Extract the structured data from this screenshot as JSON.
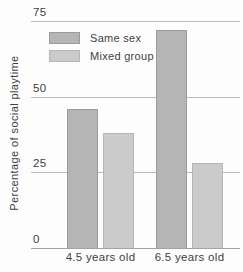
{
  "chart_data": {
    "type": "bar",
    "ylabel": "Percentage of social playtime",
    "categories": [
      "4.5 years old",
      "6.5 years old"
    ],
    "series": [
      {
        "name": "Same sex",
        "values": [
          46,
          72
        ],
        "fill": "#b5b5b5",
        "border": "#9b9b9b"
      },
      {
        "name": "Mixed group",
        "values": [
          38,
          28
        ],
        "fill": "#cbcbcb",
        "border": "#b5b5b5"
      }
    ],
    "yticks": [
      0,
      25,
      50,
      75
    ],
    "ylim": [
      0,
      75
    ],
    "grid": true,
    "legend_position": "top-left"
  },
  "colors": {
    "background": "#fdfdfd",
    "gridline": "#bababa",
    "axis_line": "#a3a3a3",
    "text": "#3f3f3f"
  }
}
